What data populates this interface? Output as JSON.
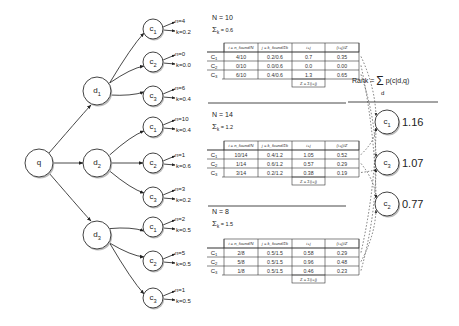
{
  "query": {
    "label": "q"
  },
  "documents": [
    {
      "label": "d1",
      "N_text": "N = 10",
      "sigma_text": "Σk = 0.6",
      "children": [
        {
          "label": "c1",
          "n": "n=4",
          "k": "k=0.2"
        },
        {
          "label": "c2",
          "n": "n=0",
          "k": "k=0.0"
        },
        {
          "label": "c3",
          "n": "n=6",
          "k": "k=0.4"
        }
      ],
      "table": {
        "headers": [
          "i = n_found/N",
          "j = k_found/Σk",
          "i+j",
          "(i+j)/Z"
        ],
        "rows": [
          {
            "cls": "C1",
            "i": "4/10",
            "j": "0.2/0.6",
            "ij": "0.7",
            "norm": "0.35"
          },
          {
            "cls": "C2",
            "i": "0/10",
            "j": "0.0/0.6",
            "ij": "0.0",
            "norm": "0.00"
          },
          {
            "cls": "C3",
            "i": "6/10",
            "j": "0.4/0.6",
            "ij": "1.3",
            "norm": "0.65"
          }
        ],
        "footer": "Z = Σ(i+j)"
      }
    },
    {
      "label": "d2",
      "N_text": "N = 14",
      "sigma_text": "Σk = 1.2",
      "children": [
        {
          "label": "c1",
          "n": "n=10",
          "k": "k=0.4"
        },
        {
          "label": "c2",
          "n": "n=1",
          "k": "k=0.6"
        },
        {
          "label": "c3",
          "n": "n=3",
          "k": "k=0.2"
        }
      ],
      "table": {
        "headers": [
          "i = n_found/N",
          "j = k_found/Σk",
          "i+j",
          "(i+j)/Z"
        ],
        "rows": [
          {
            "cls": "C1",
            "i": "10/14",
            "j": "0.4/1.2",
            "ij": "1.05",
            "norm": "0.52"
          },
          {
            "cls": "C2",
            "i": "1/14",
            "j": "0.6/1.2",
            "ij": "0.57",
            "norm": "0.29"
          },
          {
            "cls": "C3",
            "i": "3/14",
            "j": "0.2/1.2",
            "ij": "0.38",
            "norm": "0.19"
          }
        ],
        "footer": "Z = Σ(i+j)"
      }
    },
    {
      "label": "d3",
      "N_text": "N = 8",
      "sigma_text": "Σk = 1.5",
      "children": [
        {
          "label": "c1",
          "n": "n=2",
          "k": "k=0.5"
        },
        {
          "label": "c2",
          "n": "n=5",
          "k": "k=0.5"
        },
        {
          "label": "c3",
          "n": "n=1",
          "k": "k=0.5"
        }
      ],
      "table": {
        "headers": [
          "i = n_found/N",
          "j = k_found/Σk",
          "i+j",
          "(i+j)/Z"
        ],
        "rows": [
          {
            "cls": "C1",
            "i": "2/8",
            "j": "0.5/1.5",
            "ij": "0.58",
            "norm": "0.29"
          },
          {
            "cls": "C2",
            "i": "5/8",
            "j": "0.5/1.5",
            "ij": "0.96",
            "norm": "0.48"
          },
          {
            "cls": "C3",
            "i": "1/8",
            "j": "0.5/1.5",
            "ij": "0.46",
            "norm": "0.23"
          }
        ],
        "footer": "Z = Σ(i+j)"
      }
    }
  ],
  "ranking": {
    "formula": "Rank = Σ p(c|d,q)",
    "formula_sub": "d",
    "results": [
      {
        "label": "c1",
        "score": "1.16"
      },
      {
        "label": "c3",
        "score": "1.07"
      },
      {
        "label": "c2",
        "score": "0.77"
      }
    ]
  }
}
